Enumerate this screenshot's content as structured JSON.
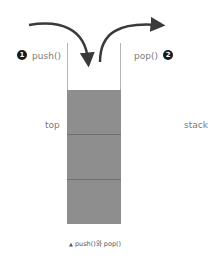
{
  "diagram": {
    "push": {
      "number": "1",
      "label": "push()"
    },
    "pop": {
      "number": "2",
      "label": "pop()"
    },
    "left_label": "top",
    "right_label": "stack",
    "caption_marker": "▲",
    "caption": "push()와 pop()",
    "stack_cells": 3,
    "colors": {
      "fill": "#8e8e8e",
      "divider": "#6f6f6f",
      "wall": "#b5b5b5",
      "arrow": "#3a3a3a"
    }
  }
}
